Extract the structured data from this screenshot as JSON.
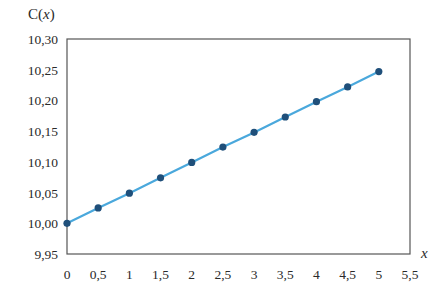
{
  "chart_data": {
    "type": "line",
    "title": "",
    "xlabel": "x",
    "ylabel": "C(x)",
    "ylabel_parts": {
      "fn": "C(",
      "var": "x",
      "close": ")"
    },
    "xlim": [
      0,
      5.5
    ],
    "ylim": [
      9.95,
      10.3
    ],
    "grid": false,
    "legend": null,
    "x_ticks": [
      0,
      0.5,
      1,
      1.5,
      2,
      2.5,
      3,
      3.5,
      4,
      4.5,
      5,
      5.5
    ],
    "x_tick_labels": [
      "0",
      "0,5",
      "1",
      "1,5",
      "2",
      "2,5",
      "3",
      "3,5",
      "4",
      "4,5",
      "5",
      "5,5"
    ],
    "y_ticks": [
      9.95,
      10.0,
      10.05,
      10.1,
      10.15,
      10.2,
      10.25,
      10.3
    ],
    "y_tick_labels": [
      "9,95",
      "10,00",
      "10,05",
      "10,10",
      "10,15",
      "10,20",
      "10,25",
      "10,30"
    ],
    "series": [
      {
        "name": "C(x)",
        "x": [
          0,
          0.5,
          1,
          1.5,
          2,
          2.5,
          3,
          3.5,
          4,
          4.5,
          5
        ],
        "values": [
          10.0,
          10.025,
          10.049,
          10.074,
          10.099,
          10.124,
          10.148,
          10.173,
          10.198,
          10.222,
          10.247
        ],
        "line_color": "#4aa8dc",
        "marker_color": "#1f4f7a",
        "marker": "circle"
      }
    ]
  },
  "colors": {
    "axis": "#555555",
    "line": "#4aa8dc",
    "marker": "#1f4f7a",
    "text": "#2a2a2a"
  }
}
